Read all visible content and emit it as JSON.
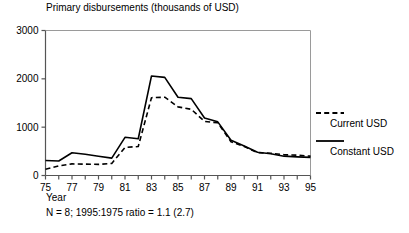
{
  "chart_data": {
    "type": "line",
    "title": "Primary disbursements (thousands of USD)",
    "xlabel": "Year",
    "ylabel": "",
    "note": "N = 8; 1995:1975 ratio = 1.1 (2.7)",
    "xlim": [
      75,
      95
    ],
    "ylim": [
      0,
      3000
    ],
    "ytick_values": [
      0,
      1000,
      2000,
      3000
    ],
    "ytick_labels": [
      "0",
      "1000",
      "2000",
      "3000"
    ],
    "xtick_values": [
      75,
      76,
      77,
      78,
      79,
      80,
      81,
      82,
      83,
      84,
      85,
      86,
      87,
      88,
      89,
      90,
      91,
      92,
      93,
      94,
      95
    ],
    "xtick_labels": [
      "75",
      "",
      "77",
      "",
      "79",
      "",
      "81",
      "",
      "83",
      "",
      "85",
      "",
      "87",
      "",
      "89",
      "",
      "91",
      "",
      "93",
      "",
      "95"
    ],
    "grid": false,
    "legend_position": "right",
    "x": [
      75,
      76,
      77,
      78,
      79,
      80,
      81,
      82,
      83,
      84,
      85,
      86,
      87,
      88,
      89,
      90,
      91,
      92,
      93,
      94,
      95
    ],
    "series": [
      {
        "name": "Current USD",
        "style": "dashed",
        "color": "#000000",
        "values": [
          130,
          200,
          240,
          235,
          230,
          250,
          580,
          600,
          1610,
          1620,
          1420,
          1370,
          1120,
          1090,
          700,
          600,
          470,
          460,
          430,
          420,
          400
        ]
      },
      {
        "name": "Constant USD",
        "style": "solid",
        "color": "#000000",
        "values": [
          310,
          300,
          470,
          440,
          400,
          360,
          790,
          760,
          2060,
          2030,
          1620,
          1590,
          1190,
          1110,
          730,
          610,
          480,
          450,
          400,
          385,
          375
        ]
      }
    ]
  },
  "legend": {
    "items": [
      {
        "label": "Current USD",
        "style": "dashed"
      },
      {
        "label": "Constant USD",
        "style": "solid"
      }
    ]
  }
}
